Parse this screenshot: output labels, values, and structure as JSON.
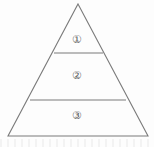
{
  "figure": {
    "name": "three-tier-pyramid",
    "shape": "triangle",
    "background_color": "#fdfdfd",
    "line_color": "#7b7b7b",
    "text_color": "#5e5e5e"
  },
  "geometry": {
    "apex": {
      "x": 78,
      "y": 4
    },
    "base_left": {
      "x": 8,
      "y": 136
    },
    "base_right": {
      "x": 148,
      "y": 136
    },
    "divider_upper": {
      "x1": 54,
      "y1": 53,
      "x2": 103,
      "y2": 53
    },
    "divider_lower": {
      "x1": 30,
      "y1": 100,
      "x2": 126,
      "y2": 100
    }
  },
  "tiers": [
    {
      "id": "tier-1",
      "label": "①",
      "position": "top"
    },
    {
      "id": "tier-2",
      "label": "②",
      "position": "middle"
    },
    {
      "id": "tier-3",
      "label": "③",
      "position": "bottom"
    }
  ]
}
